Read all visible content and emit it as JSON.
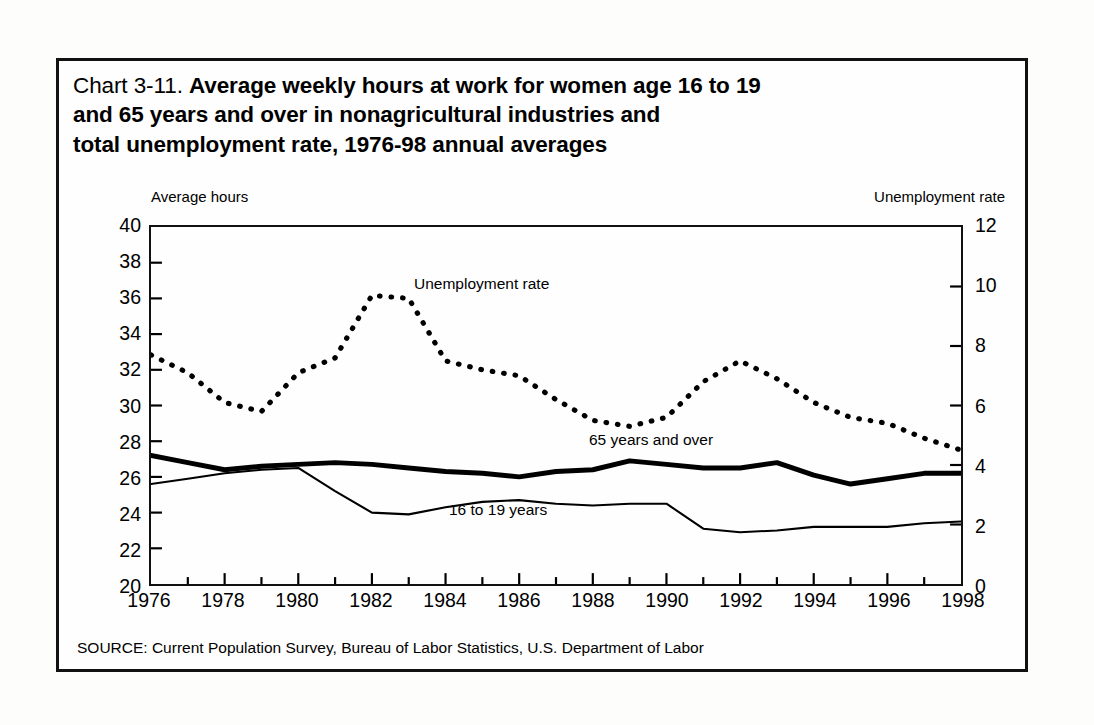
{
  "figure": {
    "title_prefix": "Chart 3-11.",
    "title_bold": "Average weekly hours at work for women age 16 to 19 and 65 years and over in nonagricultural industries and total unemployment rate, 1976-98 annual averages",
    "title_line1_bold": "Average weekly hours at work for women age 16 to 19",
    "title_line2_bold": "and 65 years and over in nonagricultural industries and",
    "title_line3_bold": "total unemployment rate, 1976-98 annual averages",
    "left_axis_caption": "Average hours",
    "right_axis_caption": "Unemployment rate",
    "source_note": "SOURCE: Current Population Survey, Bureau of Labor Statistics, U.S. Department of Labor",
    "frame_color": "#111111",
    "ink_color": "#000000",
    "background_color": "#fefefe"
  },
  "chart_data": {
    "type": "line",
    "title": "Chart 3-11. Average weekly hours at work for women age 16 to 19 and 65 years and over in nonagricultural industries and total unemployment rate, 1976-98 annual averages",
    "xlabel": "",
    "ylabel": "Average hours",
    "y2label": "Unemployment rate",
    "grid": false,
    "legend": "inline-annotations",
    "x": [
      1976,
      1977,
      1978,
      1979,
      1980,
      1981,
      1982,
      1983,
      1984,
      1985,
      1986,
      1987,
      1988,
      1989,
      1990,
      1991,
      1992,
      1993,
      1994,
      1995,
      1996,
      1997,
      1998
    ],
    "xlim": [
      1976,
      1998
    ],
    "xticks": [
      1976,
      1978,
      1980,
      1982,
      1984,
      1986,
      1988,
      1990,
      1992,
      1994,
      1996,
      1998
    ],
    "xticklabels": [
      "1976",
      "1978",
      "1980",
      "1982",
      "1984",
      "1986",
      "1988",
      "1990",
      "1992",
      "1994",
      "1996",
      "1998"
    ],
    "ylim": [
      20,
      40
    ],
    "yticks": [
      20,
      22,
      24,
      26,
      28,
      30,
      32,
      34,
      36,
      38,
      40
    ],
    "yticklabels": [
      "20",
      "22",
      "24",
      "26",
      "28",
      "30",
      "32",
      "34",
      "36",
      "38",
      "40"
    ],
    "y2lim": [
      0,
      12
    ],
    "y2ticks": [
      0,
      2,
      4,
      6,
      8,
      10,
      12
    ],
    "y2ticklabels": [
      "0",
      "2",
      "4",
      "6",
      "8",
      "10",
      "12"
    ],
    "series": [
      {
        "name": "Unemployment rate",
        "axis": "right",
        "style": "dotted",
        "annotation": "Unemployment rate",
        "values": [
          7.7,
          7.1,
          6.1,
          5.8,
          7.1,
          7.6,
          9.7,
          9.6,
          7.5,
          7.2,
          7.0,
          6.2,
          5.5,
          5.3,
          5.6,
          6.8,
          7.5,
          6.9,
          6.1,
          5.6,
          5.4,
          4.9,
          4.5
        ]
      },
      {
        "name": "65 years and over",
        "axis": "left",
        "style": "solid-thick",
        "annotation": "65 years and over",
        "values": [
          27.2,
          26.8,
          26.4,
          26.6,
          26.7,
          26.8,
          26.7,
          26.5,
          26.3,
          26.2,
          26.0,
          26.3,
          26.4,
          26.9,
          26.7,
          26.5,
          26.5,
          26.8,
          26.1,
          25.6,
          25.9,
          26.2,
          26.2
        ]
      },
      {
        "name": "16 to 19 years",
        "axis": "left",
        "style": "solid-thin",
        "annotation": "16 to 19 years",
        "values": [
          25.6,
          25.9,
          26.2,
          26.4,
          26.5,
          25.2,
          24.0,
          23.9,
          24.3,
          24.6,
          24.7,
          24.5,
          24.4,
          24.5,
          24.5,
          23.1,
          22.9,
          23.0,
          23.2,
          23.2,
          23.2,
          23.4,
          23.5
        ]
      }
    ]
  }
}
